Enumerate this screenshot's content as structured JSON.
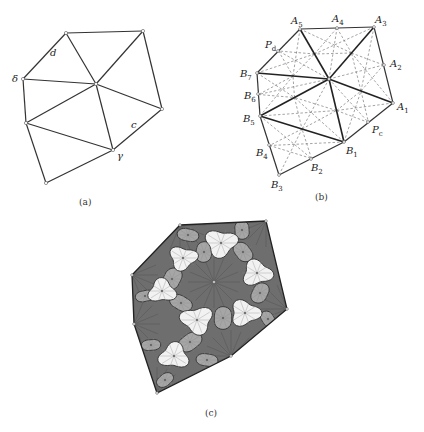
{
  "figure_a": {
    "caption": "(a)",
    "vertices": {
      "tl": [
        66,
        33
      ],
      "tr": [
        143,
        31
      ],
      "delta": [
        23,
        79
      ],
      "center": [
        96,
        84
      ],
      "right": [
        162,
        109
      ],
      "leftmid": [
        26,
        123
      ],
      "gamma": [
        113,
        150
      ],
      "bottom": [
        46,
        183
      ]
    },
    "edges": [
      [
        "tl",
        "tr"
      ],
      [
        "tl",
        "delta"
      ],
      [
        "tl",
        "center"
      ],
      [
        "tr",
        "center"
      ],
      [
        "tr",
        "right"
      ],
      [
        "delta",
        "center"
      ],
      [
        "delta",
        "leftmid"
      ],
      [
        "center",
        "right"
      ],
      [
        "center",
        "leftmid"
      ],
      [
        "center",
        "gamma"
      ],
      [
        "right",
        "gamma"
      ],
      [
        "leftmid",
        "gamma"
      ],
      [
        "leftmid",
        "bottom"
      ],
      [
        "bottom",
        "gamma"
      ]
    ],
    "labels": [
      {
        "text": "d",
        "x": 50,
        "y": 56
      },
      {
        "text": "δ",
        "x": 12,
        "y": 82
      },
      {
        "text": "c",
        "x": 131,
        "y": 128
      },
      {
        "text": "γ",
        "x": 117,
        "y": 159
      }
    ]
  },
  "figure_b": {
    "caption": "(b)",
    "vertices": {
      "A5": [
        300,
        29
      ],
      "A3": [
        374,
        27
      ],
      "C": [
        329,
        79
      ],
      "B7": [
        257,
        73
      ],
      "A1": [
        393,
        103
      ],
      "B5": [
        260,
        116
      ],
      "B1": [
        344,
        142
      ],
      "B3": [
        279,
        175
      ]
    },
    "midpoints": {
      "A4": [
        337,
        28
      ],
      "A2": [
        384,
        65
      ],
      "Pd": [
        278,
        51
      ],
      "B6": [
        258,
        94
      ],
      "Pc": [
        368,
        122
      ],
      "B4": [
        269,
        145
      ],
      "B2": [
        311,
        159
      ]
    },
    "thick_edges": [
      [
        "A5",
        "C"
      ],
      [
        "A3",
        "C"
      ],
      [
        "B7",
        "C"
      ],
      [
        "A1",
        "C"
      ],
      [
        "B5",
        "C"
      ],
      [
        "B1",
        "C"
      ],
      [
        "B5",
        "B1"
      ]
    ],
    "edges": [
      [
        "A5",
        "A3"
      ],
      [
        "A3",
        "A1"
      ],
      [
        "A5",
        "B7"
      ],
      [
        "B7",
        "B5"
      ],
      [
        "A1",
        "B1"
      ],
      [
        "B5",
        "B3"
      ],
      [
        "B3",
        "B1"
      ]
    ],
    "labels": [
      {
        "text": "A",
        "sub": "5",
        "x": 291,
        "y": 24
      },
      {
        "text": "A",
        "sub": "4",
        "x": 332,
        "y": 22
      },
      {
        "text": "A",
        "sub": "3",
        "x": 375,
        "y": 23
      },
      {
        "text": "P",
        "sub": "d",
        "x": 265,
        "y": 48
      },
      {
        "text": "A",
        "sub": "2",
        "x": 390,
        "y": 67
      },
      {
        "text": "B",
        "sub": "7",
        "x": 240,
        "y": 77
      },
      {
        "text": "B",
        "sub": "6",
        "x": 244,
        "y": 99
      },
      {
        "text": "A",
        "sub": "1",
        "x": 397,
        "y": 110
      },
      {
        "text": "B",
        "sub": "5",
        "x": 243,
        "y": 122
      },
      {
        "text": "P",
        "sub": "c",
        "x": 372,
        "y": 133
      },
      {
        "text": "B",
        "sub": "4",
        "x": 256,
        "y": 156
      },
      {
        "text": "B",
        "sub": "1",
        "x": 346,
        "y": 154
      },
      {
        "text": "B",
        "sub": "2",
        "x": 311,
        "y": 171
      },
      {
        "text": "B",
        "sub": "3",
        "x": 271,
        "y": 188
      }
    ]
  },
  "figure_c": {
    "caption": "(c)",
    "outline": [
      [
        180,
        225
      ],
      [
        266,
        221
      ],
      [
        287,
        309
      ],
      [
        231,
        356
      ],
      [
        157,
        393
      ],
      [
        134,
        324
      ],
      [
        132,
        275
      ]
    ],
    "center": [
      214,
      282
    ],
    "colors": {
      "dark": "#6e6e6e",
      "mid": "#a6a6a6",
      "light": "#f2f2f2",
      "stroke": "#333333"
    },
    "light_tiles": [
      {
        "x": 221,
        "y": 243,
        "r": 15
      },
      {
        "x": 183,
        "y": 258,
        "r": 13
      },
      {
        "x": 257,
        "y": 273,
        "r": 14
      },
      {
        "x": 162,
        "y": 291,
        "r": 13
      },
      {
        "x": 245,
        "y": 313,
        "r": 14
      },
      {
        "x": 197,
        "y": 320,
        "r": 15
      },
      {
        "x": 174,
        "y": 356,
        "r": 14
      }
    ],
    "mid_tiles": [
      {
        "x": 188,
        "y": 235,
        "r": 9
      },
      {
        "x": 242,
        "y": 230,
        "r": 9
      },
      {
        "x": 204,
        "y": 252,
        "r": 10
      },
      {
        "x": 243,
        "y": 252,
        "r": 10
      },
      {
        "x": 172,
        "y": 279,
        "r": 11
      },
      {
        "x": 260,
        "y": 293,
        "r": 10
      },
      {
        "x": 181,
        "y": 303,
        "r": 10
      },
      {
        "x": 223,
        "y": 318,
        "r": 11
      },
      {
        "x": 190,
        "y": 342,
        "r": 11
      },
      {
        "x": 268,
        "y": 319,
        "r": 8
      },
      {
        "x": 151,
        "y": 345,
        "r": 8
      },
      {
        "x": 145,
        "y": 296,
        "r": 8
      },
      {
        "x": 207,
        "y": 360,
        "r": 9
      },
      {
        "x": 165,
        "y": 380,
        "r": 8
      }
    ]
  },
  "captions": {
    "a": {
      "text": "(a)",
      "x": 87,
      "y": 205
    },
    "b": {
      "text": "(b)",
      "x": 323,
      "y": 200
    },
    "c": {
      "text": "(c)",
      "x": 213,
      "y": 416
    }
  }
}
